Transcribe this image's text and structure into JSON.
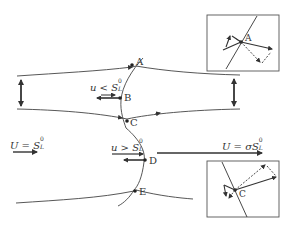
{
  "diagram": {
    "points": {
      "A": "A",
      "B": "B",
      "C": "C",
      "D": "D",
      "E": "E"
    },
    "labels": {
      "u_less": {
        "base": "u < S",
        "sub": "L",
        "sup": "0"
      },
      "u_greater": {
        "base": "u > S",
        "sub": "L",
        "sup": "0"
      },
      "U_inlet": {
        "base": "U = S",
        "sub": "L",
        "sup": "0"
      },
      "U_outlet": {
        "base": "U = σS",
        "sub": "L",
        "sup": "0"
      }
    },
    "insets": [
      {
        "name": "inset-A",
        "point": "A"
      },
      {
        "name": "inset-C",
        "point": "C"
      }
    ],
    "colors": {
      "line": "#333333",
      "inset_border": "#555555",
      "background": "#ffffff"
    }
  }
}
